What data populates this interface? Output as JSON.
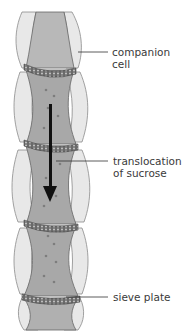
{
  "figure": {
    "labels": [
      {
        "id": "companion-cell",
        "text_line1": "companion",
        "text_line2": "cell"
      },
      {
        "id": "translocation",
        "text_line1": "translocation",
        "text_line2": "of sucrose"
      },
      {
        "id": "sieve-plate",
        "text_line1": "sieve plate",
        "text_line2": ""
      }
    ],
    "colors": {
      "companion_cell_fill": "#e6e6e6",
      "sieve_tube_fill": "#a9a9a9",
      "sieve_plate": "#555555",
      "arrow": "#111111",
      "outline": "#7a7a7a"
    }
  }
}
